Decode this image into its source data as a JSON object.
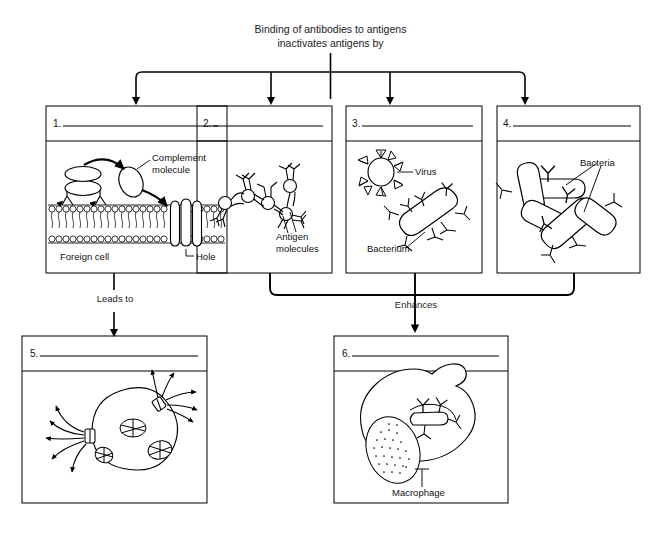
{
  "diagram": {
    "title": "Binding of antibodies to antigens\ninactivates antigens by",
    "type": "flowchart",
    "background": "#ffffff",
    "line_color": "#000000"
  },
  "connectors": [
    {
      "name": "trunk-to-four",
      "label": "",
      "from": "title",
      "to": [
        "panel-1",
        "panel-2",
        "panel-3",
        "panel-4"
      ]
    },
    {
      "name": "leads-to",
      "label": "Leads to",
      "from": "panel-1",
      "to": "panel-5"
    },
    {
      "name": "enhances",
      "label": "Enhances",
      "from": [
        "panel-2",
        "panel-3",
        "panel-4"
      ],
      "to": "panel-6"
    }
  ],
  "panels": [
    {
      "id": "panel-1",
      "number": "1.",
      "answer_line": "",
      "figure": "foreign-cell-membrane-lysis",
      "labels": [
        {
          "name": "complement-molecule-label",
          "text": "Complement\nmolecule"
        },
        {
          "name": "foreign-cell-label",
          "text": "Foreign cell"
        },
        {
          "name": "hole-label",
          "text": "Hole"
        }
      ]
    },
    {
      "id": "panel-2",
      "number": "2.",
      "answer_line": "",
      "figure": "antibody-antigen-lattice",
      "labels": [
        {
          "name": "antigen-molecules-label",
          "text": "Antigen\nmolecules"
        }
      ]
    },
    {
      "id": "panel-3",
      "number": "3.",
      "answer_line": "",
      "figure": "antibody-coated-virus-and-bacterium",
      "labels": [
        {
          "name": "virus-label",
          "text": "Virus"
        },
        {
          "name": "bacterium-label",
          "text": "Bacterium"
        }
      ]
    },
    {
      "id": "panel-4",
      "number": "4.",
      "answer_line": "",
      "figure": "agglutinated-bacteria",
      "labels": [
        {
          "name": "bacteria-label",
          "text": "Bacteria"
        }
      ]
    },
    {
      "id": "panel-5",
      "number": "5.",
      "answer_line": "",
      "figure": "lysing-cell-contents-escaping",
      "labels": []
    },
    {
      "id": "panel-6",
      "number": "6.",
      "answer_line": "",
      "figure": "macrophage-phagocytosis",
      "labels": [
        {
          "name": "macrophage-label",
          "text": "Macrophage"
        }
      ]
    }
  ]
}
